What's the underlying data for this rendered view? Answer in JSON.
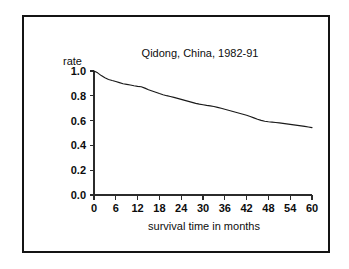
{
  "figure": {
    "background_color": "#ffffff",
    "frame_color": "#141414",
    "line_color": "#1a1a1a"
  },
  "chart_data": {
    "type": "line",
    "title": "Qidong, China, 1982-91",
    "xlabel": "survival time in months",
    "ylabel": "rate",
    "ylabel_placement": "above-axis-left",
    "xlim": [
      0,
      60
    ],
    "ylim": [
      0.0,
      1.0
    ],
    "grid": false,
    "legend": null,
    "xticks": [
      0,
      6,
      12,
      18,
      24,
      30,
      36,
      42,
      48,
      54,
      60
    ],
    "xticklabels": [
      "0",
      "6",
      "12",
      "18",
      "24",
      "30",
      "36",
      "42",
      "48",
      "54",
      "60"
    ],
    "yticks": [
      0.0,
      0.2,
      0.4,
      0.6,
      0.8,
      1.0
    ],
    "yticklabels": [
      "0.0",
      "0.2",
      "0.4",
      "0.6",
      "0.8",
      "1.0"
    ],
    "series": [
      {
        "name": "survival rate",
        "x": [
          0,
          1,
          2,
          3,
          4,
          5,
          6,
          7,
          8,
          9,
          10,
          11,
          12,
          13,
          14,
          15,
          16,
          17,
          18,
          19,
          20,
          21,
          22,
          23,
          24,
          25,
          26,
          27,
          28,
          29,
          30,
          31,
          32,
          33,
          34,
          35,
          36,
          37,
          38,
          39,
          40,
          41,
          42,
          43,
          44,
          45,
          46,
          47,
          48,
          49,
          50,
          51,
          52,
          53,
          54,
          55,
          56,
          57,
          58,
          59,
          60
        ],
        "y": [
          1.0,
          0.985,
          0.963,
          0.945,
          0.932,
          0.923,
          0.915,
          0.906,
          0.897,
          0.892,
          0.887,
          0.881,
          0.876,
          0.873,
          0.862,
          0.849,
          0.839,
          0.829,
          0.818,
          0.809,
          0.801,
          0.794,
          0.787,
          0.779,
          0.771,
          0.763,
          0.755,
          0.747,
          0.739,
          0.733,
          0.728,
          0.723,
          0.719,
          0.714,
          0.707,
          0.699,
          0.691,
          0.683,
          0.675,
          0.667,
          0.659,
          0.651,
          0.643,
          0.633,
          0.622,
          0.611,
          0.602,
          0.595,
          0.591,
          0.588,
          0.585,
          0.582,
          0.578,
          0.574,
          0.57,
          0.566,
          0.562,
          0.558,
          0.553,
          0.548,
          0.543
        ]
      }
    ]
  }
}
